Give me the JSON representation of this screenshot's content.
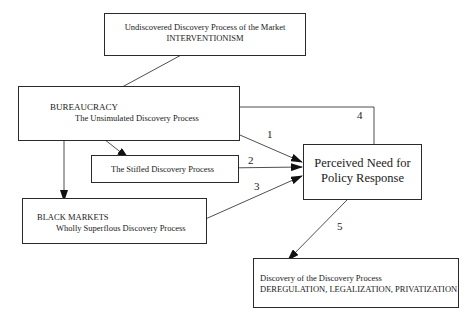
{
  "diagram": {
    "nodes": {
      "interventionism": {
        "line1": "Undiscovered Discovery Process of the Market",
        "line2": "INTERVENTIONISM"
      },
      "bureaucracy": {
        "line1": "BUREAUCRACY",
        "line2": "The Unsimulated Discovery Process"
      },
      "stifled": {
        "line1": "The Stifled Discovery Process"
      },
      "black_markets": {
        "line1": "BLACK MARKETS",
        "line2": "Wholly Superflous Discovery Process"
      },
      "perceived_need": {
        "line1": "Perceived Need for",
        "line2": "Policy Response"
      },
      "discovery": {
        "line1": "Discovery of the Discovery Process",
        "line2": "DEREGULATION, LEGALIZATION, PRIVATIZATION"
      }
    },
    "edge_labels": {
      "e1": "1",
      "e2": "2",
      "e3": "3",
      "e4": "4",
      "e5": "5"
    },
    "edges": [
      {
        "from": "interventionism",
        "to": "bureaucracy",
        "label": ""
      },
      {
        "from": "bureaucracy",
        "to": "stifled",
        "label": ""
      },
      {
        "from": "bureaucracy",
        "to": "black_markets",
        "label": ""
      },
      {
        "from": "bureaucracy",
        "to": "perceived_need",
        "label": "1"
      },
      {
        "from": "stifled",
        "to": "perceived_need",
        "label": "2"
      },
      {
        "from": "black_markets",
        "to": "perceived_need",
        "label": "3"
      },
      {
        "from": "perceived_need",
        "to": "bureaucracy",
        "label": "4"
      },
      {
        "from": "perceived_need",
        "to": "discovery",
        "label": "5"
      }
    ]
  }
}
